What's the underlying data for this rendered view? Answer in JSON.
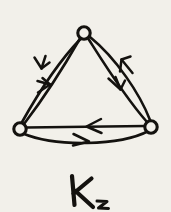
{
  "figure": {
    "caption": "K",
    "caption_subscript": "3",
    "background_color": "#f2f0ea",
    "ink_color": "#14120f",
    "vertices": [
      {
        "id": "top",
        "label": "",
        "x": 84,
        "y": 33,
        "radius": 6.2
      },
      {
        "id": "left",
        "label": "",
        "x": 20,
        "y": 129,
        "radius": 6.2
      },
      {
        "id": "right",
        "label": "",
        "x": 151,
        "y": 127,
        "radius": 6.2
      }
    ],
    "edges": [
      {
        "id": "top-to-left-outer",
        "from": "top",
        "to": "left",
        "curvature": "bowed-outward",
        "arrow_direction": "down-left",
        "arrow_x": 42,
        "arrow_y": 66
      },
      {
        "id": "left-to-top-inner",
        "from": "left",
        "to": "top",
        "curvature": "straight",
        "arrow_direction": "up-right",
        "arrow_x": 46,
        "arrow_y": 88
      },
      {
        "id": "top-to-right-inner",
        "from": "top",
        "to": "right",
        "curvature": "straight",
        "arrow_direction": "down-right",
        "arrow_x": 119,
        "arrow_y": 86
      },
      {
        "id": "right-to-top-outer",
        "from": "right",
        "to": "top",
        "curvature": "bowed-outward",
        "arrow_direction": "up-left",
        "arrow_x": 126,
        "arrow_y": 63
      },
      {
        "id": "right-to-left-straight",
        "from": "right",
        "to": "left",
        "curvature": "straight",
        "arrow_direction": "left",
        "arrow_x": 92,
        "arrow_y": 125
      },
      {
        "id": "left-to-right-bowed",
        "from": "left",
        "to": "right",
        "curvature": "bowed-downward",
        "arrow_direction": "right",
        "arrow_x": 85,
        "arrow_y": 140
      }
    ],
    "edge_count": 6,
    "vertex_count": 3,
    "style": "hand-drawn ink on paper"
  }
}
